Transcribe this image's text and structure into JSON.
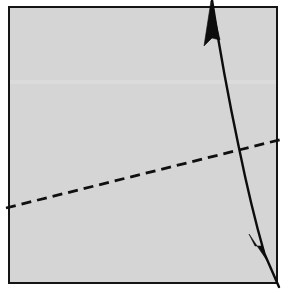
{
  "figure": {
    "type": "geometric-diagram",
    "canvas": {
      "width": 288,
      "height": 293,
      "page_background": "#ffffff"
    },
    "panel": {
      "name": "diagram-panel",
      "fill": "#d5d5d5",
      "border_color": "#141414",
      "border_width": 2,
      "left": 8,
      "top": 6,
      "right": 278,
      "bottom": 284
    },
    "artifact_band": {
      "name": "faint-horizontal-band",
      "color": "#e0e0e0",
      "y": 80,
      "height": 4,
      "opacity": 0.55,
      "note": "faint lighter horizontal compression band"
    },
    "curved_arrow": {
      "name": "curved-double-arrow",
      "stroke": "#0d0d0d",
      "stroke_width": 2.4,
      "arrowheads": "both",
      "top_tip": [
        212,
        0
      ],
      "bottom_tip": [
        264,
        252
      ],
      "tail_end": [
        278,
        286
      ],
      "path": "M 212 0 C 219 46, 228 96, 239 148 C 248 192, 256 224, 264 252",
      "tail_path": "M 262 248 L 279 287",
      "head_top": {
        "name": "arrowhead-up",
        "tip": [
          211,
          1
        ],
        "left": [
          204,
          46
        ],
        "right": [
          220,
          40
        ],
        "direction": "up"
      },
      "head_bottom": {
        "name": "arrowhead-down",
        "tip": [
          268,
          262
        ],
        "left": [
          249,
          234
        ],
        "right": [
          262,
          246
        ],
        "direction": "down-right"
      }
    },
    "dashed_line": {
      "name": "dashed-reference-line",
      "stroke": "#101010",
      "stroke_width": 2.8,
      "dash_length": 10,
      "gap_length": 6,
      "start": [
        6,
        208
      ],
      "end": [
        283,
        139
      ],
      "description": "straight dashed line rising gently from lower-left to upper-right"
    }
  }
}
